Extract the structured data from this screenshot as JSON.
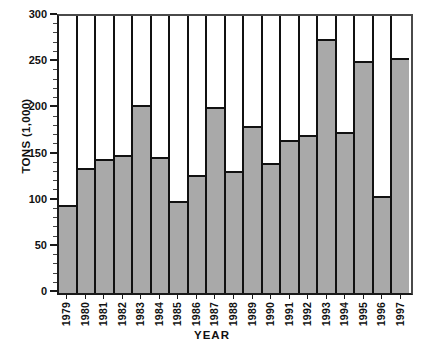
{
  "chart_data": {
    "type": "bar",
    "title": "",
    "xlabel": "YEAR",
    "ylabel": "TONS (1,000)",
    "categories": [
      "1979",
      "1980",
      "1981",
      "1982",
      "1983",
      "1984",
      "1985",
      "1986",
      "1987",
      "1988",
      "1989",
      "1990",
      "1991",
      "1992",
      "1993",
      "1994",
      "1995",
      "1996",
      "1997"
    ],
    "values": [
      95,
      135,
      145,
      150,
      204,
      147,
      100,
      128,
      201,
      132,
      181,
      141,
      166,
      171,
      275,
      174,
      251,
      105,
      254
    ],
    "ylim": [
      0,
      300
    ],
    "xlim_categorical": true,
    "y_major_ticks": [
      0,
      50,
      100,
      150,
      200,
      250,
      300
    ],
    "y_tick_labels": [
      "0",
      "50",
      "100",
      "150",
      "200",
      "250",
      "300"
    ],
    "y_minor_tick_interval": 10,
    "grid": false,
    "legend": "none",
    "bar_fill_color": "#a9a9a9",
    "bar_edge_color": "#111111",
    "axis_color": "#1a1a1a",
    "background_color": "#ffffff"
  },
  "axes": {
    "y_title": "TONS (1,000)",
    "x_title": "YEAR"
  }
}
